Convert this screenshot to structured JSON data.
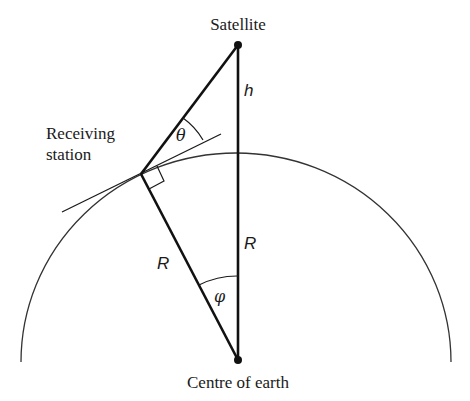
{
  "diagram": {
    "labels": {
      "satellite": "Satellite",
      "receiving_station_line1": "Receiving",
      "receiving_station_line2": "station",
      "centre": "Centre of earth",
      "height": "h",
      "radius_left": "R",
      "radius_right": "R",
      "elevation_angle": "θ",
      "central_angle": "φ"
    },
    "points": {
      "satellite": {
        "x": 238,
        "y": 45
      },
      "receiving_station": {
        "x": 141,
        "y": 174
      },
      "centre": {
        "x": 238,
        "y": 360
      }
    },
    "earth_radius_px": 208,
    "colors": {
      "line": "#1a1a1a",
      "background": "#ffffff"
    }
  }
}
